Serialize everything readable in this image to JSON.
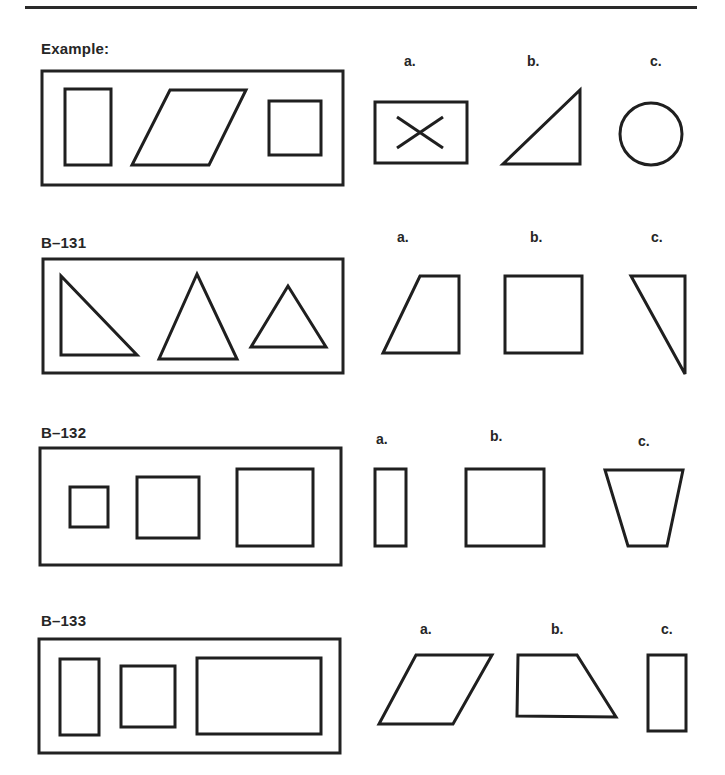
{
  "page": {
    "items": [
      {
        "id": "example",
        "title": "Example:",
        "stimulus": [
          "tall-rectangle",
          "parallelogram",
          "square"
        ],
        "options": [
          {
            "letter": "a.",
            "shape": "rectangle-with-x"
          },
          {
            "letter": "b.",
            "shape": "right-triangle"
          },
          {
            "letter": "c.",
            "shape": "circle"
          }
        ]
      },
      {
        "id": "b131",
        "title": "B–131",
        "stimulus": [
          "right-triangle",
          "tall-triangle",
          "small-triangle"
        ],
        "options": [
          {
            "letter": "a.",
            "shape": "trapezoid"
          },
          {
            "letter": "b.",
            "shape": "square"
          },
          {
            "letter": "c.",
            "shape": "narrow-right-triangle"
          }
        ]
      },
      {
        "id": "b132",
        "title": "B–132",
        "stimulus": [
          "small-square",
          "medium-square",
          "large-square"
        ],
        "options": [
          {
            "letter": "a.",
            "shape": "narrow-rectangle"
          },
          {
            "letter": "b.",
            "shape": "square"
          },
          {
            "letter": "c.",
            "shape": "inverted-trapezoid"
          }
        ]
      },
      {
        "id": "b133",
        "title": "B–133",
        "stimulus": [
          "tall-rectangle",
          "square",
          "wide-rectangle"
        ],
        "options": [
          {
            "letter": "a.",
            "shape": "parallelogram"
          },
          {
            "letter": "b.",
            "shape": "trapezoid"
          },
          {
            "letter": "c.",
            "shape": "tall-rectangle"
          }
        ]
      }
    ]
  }
}
